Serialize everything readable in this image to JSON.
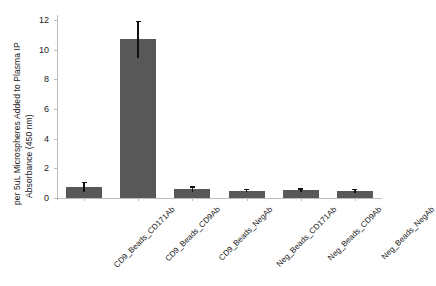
{
  "chart_data": {
    "type": "bar",
    "title": "",
    "xlabel": "",
    "ylabel_line1": "Absorbance (450 nm)",
    "ylabel_line2": "per 5uL Microspheres Added to Plasma IP",
    "categories": [
      "CD9_Beads_CD171Ab",
      "CD9_Beads_CD9Ab",
      "CD9_Beads_NegAb",
      "Neg_Beads_CD171Ab",
      "Neg_Beads_CD9Ab",
      "Neg_Beads_NegAb"
    ],
    "values": [
      0.75,
      10.7,
      0.6,
      0.5,
      0.52,
      0.48
    ],
    "errors": [
      0.35,
      1.25,
      0.18,
      0.12,
      0.14,
      0.12
    ],
    "ylim": [
      0,
      12.2
    ],
    "yticks": [
      0,
      2,
      4,
      6,
      8,
      10,
      12
    ],
    "ytick_labels": [
      "0",
      "2",
      "4",
      "6",
      "8",
      "10",
      "12"
    ],
    "grid": false,
    "legend": "none",
    "bar_color": "#585858",
    "error_color": "#111111",
    "axis_color": "#bdbdbd",
    "text_color": "#1a1a1a"
  }
}
